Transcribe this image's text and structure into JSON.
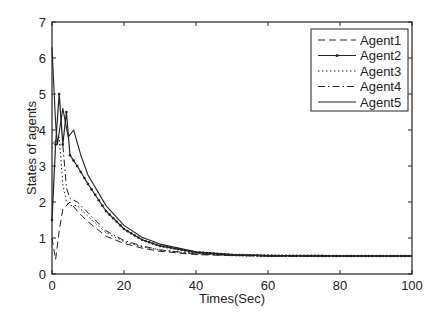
{
  "chart_data": {
    "type": "line",
    "title": "",
    "xlabel": "Times(Sec)",
    "ylabel": "States of agents",
    "xlim": [
      0,
      100
    ],
    "ylim": [
      0,
      7
    ],
    "xticks": [
      0,
      20,
      40,
      60,
      80,
      100
    ],
    "yticks": [
      0,
      1,
      2,
      3,
      4,
      5,
      6,
      7
    ],
    "grid": false,
    "legend_position": "upper right",
    "series": [
      {
        "name": "Agent1",
        "style": "dashed",
        "x": [
          0,
          1,
          2,
          3,
          5,
          7,
          10,
          15,
          20,
          25,
          30,
          40,
          50,
          60,
          80,
          100
        ],
        "y": [
          1.0,
          0.4,
          1.2,
          1.8,
          2.0,
          1.75,
          1.45,
          1.05,
          0.85,
          0.72,
          0.63,
          0.54,
          0.51,
          0.5,
          0.5,
          0.5
        ]
      },
      {
        "name": "Agent2",
        "style": "solid-dot-marker",
        "x": [
          0,
          1,
          2,
          3,
          4,
          5,
          7,
          10,
          15,
          20,
          25,
          30,
          40,
          50,
          60,
          80,
          100
        ],
        "y": [
          1.5,
          3.6,
          5.0,
          3.6,
          4.5,
          3.3,
          3.0,
          2.5,
          1.75,
          1.25,
          0.95,
          0.78,
          0.6,
          0.53,
          0.51,
          0.5,
          0.5
        ]
      },
      {
        "name": "Agent3",
        "style": "dotted",
        "x": [
          0,
          1,
          2,
          3,
          4,
          5,
          7,
          10,
          15,
          20,
          25,
          30,
          40,
          50,
          60,
          80,
          100
        ],
        "y": [
          3.5,
          3.6,
          3.8,
          2.5,
          2.0,
          1.9,
          1.9,
          1.6,
          1.15,
          0.9,
          0.76,
          0.66,
          0.56,
          0.52,
          0.5,
          0.5,
          0.5
        ]
      },
      {
        "name": "Agent4",
        "style": "dash-dot",
        "x": [
          0,
          1,
          2,
          3,
          4,
          5,
          7,
          10,
          15,
          20,
          25,
          30,
          40,
          50,
          60,
          80,
          100
        ],
        "y": [
          3.6,
          3.7,
          3.6,
          3.6,
          2.4,
          2.1,
          2.0,
          1.7,
          1.2,
          0.93,
          0.78,
          0.67,
          0.56,
          0.52,
          0.5,
          0.5,
          0.5
        ]
      },
      {
        "name": "Agent5",
        "style": "solid",
        "x": [
          0,
          1,
          1.5,
          3,
          4.5,
          6,
          8,
          10,
          15,
          20,
          25,
          30,
          40,
          50,
          60,
          80,
          100
        ],
        "y": [
          6.3,
          4.2,
          3.6,
          4.6,
          3.8,
          4.0,
          3.3,
          2.75,
          1.9,
          1.35,
          1.02,
          0.83,
          0.62,
          0.54,
          0.51,
          0.5,
          0.5
        ]
      }
    ]
  },
  "legend": {
    "items": [
      {
        "label": "Agent1"
      },
      {
        "label": "Agent2"
      },
      {
        "label": "Agent3"
      },
      {
        "label": "Agent4"
      },
      {
        "label": "Agent5"
      }
    ]
  },
  "axes": {
    "xlabel": "Times(Sec)",
    "ylabel": "States of agents",
    "xtick_labels": [
      "0",
      "20",
      "40",
      "60",
      "80",
      "100"
    ],
    "ytick_labels": [
      "0",
      "1",
      "2",
      "3",
      "4",
      "5",
      "6",
      "7"
    ]
  }
}
